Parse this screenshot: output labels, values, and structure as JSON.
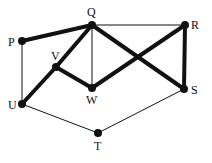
{
  "diagram": {
    "type": "graph",
    "nodes": [
      {
        "id": "P",
        "label": "P",
        "x": 22,
        "y": 41,
        "lx": 8,
        "ly": 46
      },
      {
        "id": "Q",
        "label": "Q",
        "x": 92,
        "y": 25,
        "lx": 87,
        "ly": 16
      },
      {
        "id": "R",
        "label": "R",
        "x": 185,
        "y": 25,
        "lx": 191,
        "ly": 29
      },
      {
        "id": "V",
        "label": "V",
        "x": 56,
        "y": 67,
        "lx": 51,
        "ly": 60
      },
      {
        "id": "U",
        "label": "U",
        "x": 22,
        "y": 104,
        "lx": 8,
        "ly": 109
      },
      {
        "id": "W",
        "label": "W",
        "x": 92,
        "y": 88,
        "lx": 86,
        "ly": 104
      },
      {
        "id": "S",
        "label": "S",
        "x": 184,
        "y": 89,
        "lx": 191,
        "ly": 94
      },
      {
        "id": "T",
        "label": "T",
        "x": 98,
        "y": 133,
        "lx": 94,
        "ly": 150
      }
    ],
    "edges": [
      {
        "from": "P",
        "to": "U",
        "weight": "thin"
      },
      {
        "from": "Q",
        "to": "R",
        "weight": "thin"
      },
      {
        "from": "Q",
        "to": "W",
        "weight": "thin"
      },
      {
        "from": "U",
        "to": "T",
        "weight": "thin"
      },
      {
        "from": "T",
        "to": "S",
        "weight": "thin"
      },
      {
        "from": "P",
        "to": "Q",
        "weight": "thick"
      },
      {
        "from": "Q",
        "to": "V",
        "weight": "thick"
      },
      {
        "from": "V",
        "to": "U",
        "weight": "thick"
      },
      {
        "from": "V",
        "to": "W",
        "weight": "thick"
      },
      {
        "from": "W",
        "to": "R",
        "weight": "thick"
      },
      {
        "from": "Q",
        "to": "S",
        "weight": "thick"
      },
      {
        "from": "R",
        "to": "S",
        "weight": "thick"
      }
    ]
  }
}
